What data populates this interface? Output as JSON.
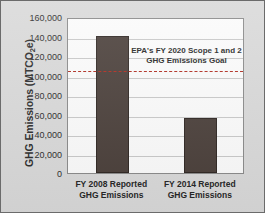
{
  "chart_data": {
    "type": "bar",
    "title": "",
    "xlabel": "",
    "ylabel": "GHG Emissions (MTCO2e)",
    "ylabel_prefix": "GHG Emissions (MTCO",
    "ylabel_sub": "2",
    "ylabel_suffix": "e)",
    "categories": [
      "FY 2008 Reported\nGHG Emissions",
      "FY 2014 Reported\nGHG Emissions"
    ],
    "category_lines": [
      [
        "FY 2008 Reported",
        "GHG Emissions"
      ],
      [
        "FY 2014 Reported",
        "GHG Emissions"
      ]
    ],
    "values": [
      140500,
      56000
    ],
    "ylim": [
      0,
      160000
    ],
    "ytick_values": [
      0,
      20000,
      40000,
      60000,
      80000,
      100000,
      120000,
      140000,
      160000
    ],
    "ytick_labels": [
      "0",
      "20,000",
      "40,000",
      "60,000",
      "80,000",
      "100,000",
      "120,000",
      "140,000",
      "160,000"
    ],
    "grid": true,
    "legend": "none",
    "annotations": [
      {
        "name": "goal-annotation",
        "lines": [
          "EPA's FY 2020 Scope 1 and 2",
          "GHG Emissions Goal"
        ],
        "value": 107000
      }
    ],
    "reference_lines": [
      {
        "name": "epa-fy2020-goal-line",
        "value": 107000,
        "style": "dashed",
        "color": "#b02a1e"
      }
    ],
    "colors": {
      "bar": "#4a3f3a",
      "bar_border": "#2e2622",
      "goal_line": "#b02a1e",
      "plot_background": "#fbfbfb",
      "figure_background": "#d9d9d9",
      "gridline": "#c9c9c9",
      "text": "#262626"
    }
  }
}
